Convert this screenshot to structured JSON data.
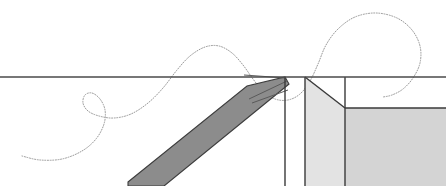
{
  "figure": {
    "width": 446,
    "height": 186,
    "background_color": "#ffffff"
  },
  "colors": {
    "background": "#ffffff",
    "datum_line": "#4a4a4a",
    "dark_band_fill": "#8c8c8c",
    "dark_band_stroke": "#3d3d3d",
    "light_polygon_fill": "#e3e3e3",
    "mid_polygon_fill": "#d4d4d4",
    "outline": "#3a3a3a",
    "dotted_curve": "#9a9a9a",
    "thin_line": "#5a5a5a"
  },
  "chart_data": {
    "type": "scatter",
    "xlabel": "",
    "ylabel": "",
    "xlim": [
      0,
      446
    ],
    "ylim": [
      186,
      0
    ],
    "grid": false,
    "legend": "none",
    "annotations": [
      "horizontal datum line spanning full width at y=77",
      "dark diagonal band from lower-left to apex at upper right",
      "light gray polygon with diagonal top-right edge",
      "mid gray rectangle at lower right",
      "dotted trajectory curve with small left loop and large right loop"
    ],
    "series": [
      {
        "name": "datum-line",
        "kind": "line",
        "points": [
          [
            0,
            77
          ],
          [
            446,
            77
          ]
        ]
      },
      {
        "name": "dark-band",
        "kind": "polygon",
        "points": [
          [
            128,
            182
          ],
          [
            247,
            86
          ],
          [
            285,
            77
          ],
          [
            289,
            84
          ],
          [
            164,
            186
          ],
          [
            128,
            186
          ]
        ]
      },
      {
        "name": "thin-line-upper",
        "kind": "line",
        "points": [
          [
            244,
            75
          ],
          [
            286,
            78
          ]
        ]
      },
      {
        "name": "thin-line-mid",
        "kind": "line",
        "points": [
          [
            249,
            99
          ],
          [
            287,
            81
          ]
        ]
      },
      {
        "name": "thin-line-lower",
        "kind": "line",
        "points": [
          [
            252,
            103
          ],
          [
            288,
            90
          ]
        ]
      },
      {
        "name": "vertical-line-a",
        "kind": "line",
        "points": [
          [
            285,
            77
          ],
          [
            285,
            186
          ]
        ]
      },
      {
        "name": "vertical-line-b",
        "kind": "line",
        "points": [
          [
            305,
            77
          ],
          [
            305,
            186
          ]
        ]
      },
      {
        "name": "light-polygon",
        "kind": "polygon",
        "points": [
          [
            305,
            77
          ],
          [
            345,
            108
          ],
          [
            345,
            186
          ],
          [
            305,
            186
          ]
        ]
      },
      {
        "name": "vertical-line-c",
        "kind": "line",
        "points": [
          [
            345,
            77
          ],
          [
            345,
            186
          ]
        ]
      },
      {
        "name": "mid-rectangle",
        "kind": "polygon",
        "points": [
          [
            345,
            108
          ],
          [
            446,
            108
          ],
          [
            446,
            186
          ],
          [
            345,
            186
          ]
        ]
      },
      {
        "name": "dotted-curve",
        "kind": "path",
        "points": [
          [
            22,
            156
          ],
          [
            40,
            160
          ],
          [
            62,
            159
          ],
          [
            82,
            151
          ],
          [
            96,
            139
          ],
          [
            104,
            124
          ],
          [
            105,
            110
          ],
          [
            100,
            99
          ],
          [
            92,
            93
          ],
          [
            85,
            95
          ],
          [
            83,
            103
          ],
          [
            88,
            111
          ],
          [
            99,
            116
          ],
          [
            114,
            118
          ],
          [
            131,
            114
          ],
          [
            148,
            103
          ],
          [
            163,
            88
          ],
          [
            177,
            70
          ],
          [
            190,
            56
          ],
          [
            205,
            47
          ],
          [
            219,
            46
          ],
          [
            232,
            53
          ],
          [
            243,
            65
          ],
          [
            253,
            79
          ],
          [
            263,
            91
          ],
          [
            275,
            99
          ],
          [
            288,
            100
          ],
          [
            300,
            94
          ],
          [
            310,
            81
          ],
          [
            318,
            64
          ],
          [
            326,
            45
          ],
          [
            338,
            29
          ],
          [
            355,
            17
          ],
          [
            376,
            13
          ],
          [
            397,
            18
          ],
          [
            412,
            30
          ],
          [
            420,
            46
          ],
          [
            420,
            63
          ],
          [
            413,
            78
          ],
          [
            403,
            89
          ],
          [
            392,
            95
          ],
          [
            383,
            97
          ]
        ]
      }
    ]
  }
}
